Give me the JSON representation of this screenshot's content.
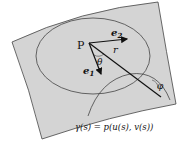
{
  "diagram": {
    "point_label": "P",
    "vector_e1": "e",
    "vector_e1_sub": "1",
    "vector_e2": "e",
    "vector_e2_sub": "2",
    "radius_label": "r",
    "angle_theta": "θ",
    "angle_phi": "φ",
    "curve_equation": "γ(s) = p(u(s), v(s))",
    "colors": {
      "surface_fill": "#d4d4d4",
      "stroke": "#333333",
      "background": "#ffffff"
    }
  }
}
